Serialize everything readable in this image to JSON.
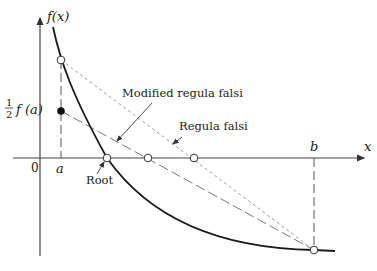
{
  "diagram": {
    "axes": {
      "y_label": "f(x)",
      "x_label": "x",
      "origin_label": "0",
      "a_label": "a",
      "b_label": "b"
    },
    "labels": {
      "half_fa_num": "1",
      "half_fa_den": "2",
      "half_fa_expr": "f (a)",
      "modified": "Modified regula falsi",
      "regula": "Regula falsi",
      "root": "Root"
    },
    "colors": {
      "curve": "#1a1a1a",
      "axis": "#333333",
      "dashed": "#8a8a8a"
    }
  }
}
